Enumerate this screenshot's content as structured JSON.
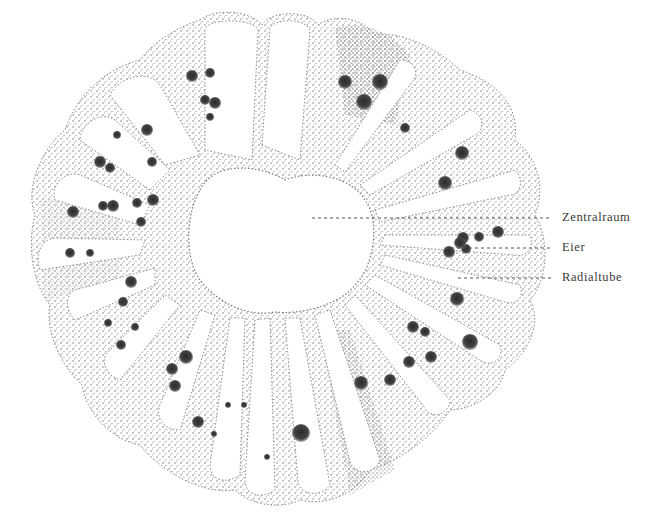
{
  "figure": {
    "colors": {
      "background": "#ffffff",
      "stipple": "#6a6a6a",
      "stipple_dense": "#4a4a4a",
      "egg": "#3a3a3a",
      "label": "#3a3a3a",
      "leader_line": "#555555"
    },
    "center": {
      "x": 282,
      "y": 248
    },
    "central_cavity": {
      "rx": 82,
      "ry": 72
    },
    "outer_ring": {
      "rx": 252,
      "ry": 240
    }
  },
  "annotations": [
    {
      "id": "zentralraum",
      "label": "Zentralraum",
      "line": {
        "x1": 312,
        "y1": 218,
        "x2": 552,
        "y2": 218
      },
      "text_pos": {
        "x": 562,
        "y": 210
      }
    },
    {
      "id": "eier",
      "label": "Eier",
      "line": {
        "x1": 445,
        "y1": 248,
        "x2": 552,
        "y2": 248
      },
      "text_pos": {
        "x": 562,
        "y": 240
      }
    },
    {
      "id": "radialtube",
      "label": "Radialtube",
      "line": {
        "x1": 458,
        "y1": 278,
        "x2": 552,
        "y2": 278
      },
      "text_pos": {
        "x": 562,
        "y": 270
      }
    }
  ],
  "eggs": [
    [
      192,
      76,
      6
    ],
    [
      210,
      73,
      5
    ],
    [
      205,
      100,
      5
    ],
    [
      215,
      103,
      6
    ],
    [
      210,
      117,
      4
    ],
    [
      345,
      82,
      7
    ],
    [
      380,
      82,
      8
    ],
    [
      364,
      102,
      8
    ],
    [
      405,
      128,
      5
    ],
    [
      147,
      130,
      6
    ],
    [
      117,
      135,
      4
    ],
    [
      100,
      162,
      6
    ],
    [
      110,
      168,
      5
    ],
    [
      152,
      162,
      5
    ],
    [
      73,
      212,
      6
    ],
    [
      103,
      206,
      5
    ],
    [
      113,
      206,
      6
    ],
    [
      137,
      203,
      5
    ],
    [
      153,
      200,
      6
    ],
    [
      141,
      222,
      5
    ],
    [
      70,
      253,
      5
    ],
    [
      90,
      253,
      4
    ],
    [
      462,
      153,
      7
    ],
    [
      445,
      183,
      7
    ],
    [
      463,
      238,
      6
    ],
    [
      479,
      237,
      5
    ],
    [
      498,
      232,
      6
    ],
    [
      449,
      252,
      6
    ],
    [
      466,
      249,
      5
    ],
    [
      460,
      243,
      6
    ],
    [
      457,
      299,
      7
    ],
    [
      131,
      282,
      6
    ],
    [
      123,
      302,
      5
    ],
    [
      108,
      323,
      4
    ],
    [
      121,
      345,
      5
    ],
    [
      135,
      327,
      4
    ],
    [
      413,
      327,
      6
    ],
    [
      425,
      332,
      5
    ],
    [
      470,
      342,
      8
    ],
    [
      431,
      357,
      6
    ],
    [
      409,
      362,
      6
    ],
    [
      186,
      357,
      7
    ],
    [
      172,
      369,
      6
    ],
    [
      175,
      386,
      6
    ],
    [
      228,
      405,
      3
    ],
    [
      361,
      383,
      7
    ],
    [
      390,
      380,
      6
    ],
    [
      198,
      422,
      6
    ],
    [
      214,
      434,
      3
    ],
    [
      244,
      405,
      3
    ],
    [
      301,
      433,
      9
    ],
    [
      267,
      457,
      3
    ]
  ],
  "chambers": 20
}
